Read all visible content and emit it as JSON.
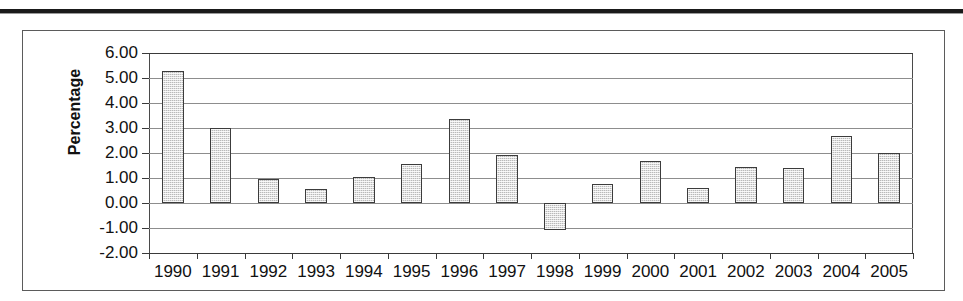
{
  "page": {
    "separator_rule": "horizontal-rule"
  },
  "chart_data": {
    "type": "bar",
    "title": "",
    "xlabel": "",
    "ylabel": "Percentage",
    "categories": [
      "1990",
      "1991",
      "1992",
      "1993",
      "1994",
      "1995",
      "1996",
      "1997",
      "1998",
      "1999",
      "2000",
      "2001",
      "2002",
      "2003",
      "2004",
      "2005"
    ],
    "values": [
      5.3,
      3.02,
      0.95,
      0.55,
      1.03,
      1.57,
      3.35,
      1.93,
      -1.08,
      0.78,
      1.68,
      0.6,
      1.45,
      1.42,
      2.7,
      2.0
    ],
    "ylim": [
      -2.0,
      6.0
    ],
    "ytick_step": 1.0,
    "ytick_labels": [
      "6.00",
      "5.00",
      "4.00",
      "3.00",
      "2.00",
      "1.00",
      "0.00",
      "-1.00",
      "-2.00"
    ],
    "ytick_values": [
      6.0,
      5.0,
      4.0,
      3.0,
      2.0,
      1.0,
      0.0,
      -1.0,
      -2.0
    ],
    "grid": true,
    "legend": false,
    "series_name": "Percentage",
    "bar_fill_color": "#b9b9b9",
    "bar_border_color": "#3c3c3c",
    "gridline_color": "#8d8d8d",
    "axis_color": "#3a3a3a",
    "plot_background": "#ffffff",
    "frame_border_color": "#5b5b5b"
  }
}
